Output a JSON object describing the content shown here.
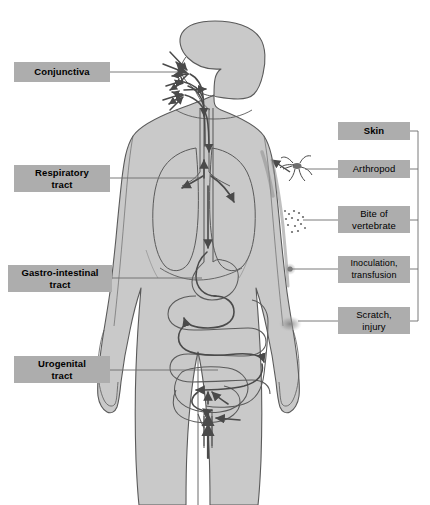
{
  "figure": {
    "background_color": "#ffffff",
    "body_fill": "#c9c9c9",
    "outline_color": "#5a5a5a",
    "arrow_color": "#4a4a4a",
    "label_box_color": "#adadad",
    "label_text_color": "#000000"
  },
  "left_labels": [
    {
      "id": "conjunctiva",
      "text": "Conjunctiva"
    },
    {
      "id": "respiratory",
      "text": "Respiratory\ntract",
      "line1": "Respiratory",
      "line2": "tract"
    },
    {
      "id": "gastro",
      "text": "Gastro-intestinal\ntract",
      "line1": "Gastro-intestinal",
      "line2": "tract"
    },
    {
      "id": "urogenital",
      "text": "Urogenital\ntract",
      "line1": "Urogenital",
      "line2": "tract"
    }
  ],
  "right_group": {
    "heading": "Skin",
    "items": [
      {
        "id": "arthropod",
        "line1": "Arthropod",
        "line2": ""
      },
      {
        "id": "bite",
        "line1": "Bite of",
        "line2": "vertebrate"
      },
      {
        "id": "inoculation",
        "line1": "Inoculation,",
        "line2": "transfusion"
      },
      {
        "id": "scratch",
        "line1": "Scratch,",
        "line2": "injury"
      }
    ]
  }
}
